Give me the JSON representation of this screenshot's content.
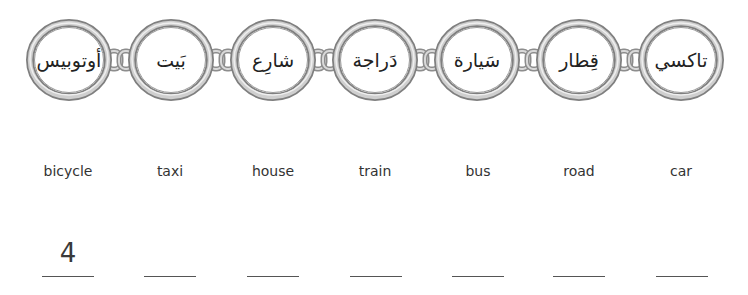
{
  "exercise": {
    "type": "match-arabic-to-english",
    "chain_rings": [
      {
        "arabic": "أوتوبيس"
      },
      {
        "arabic": "بَيت"
      },
      {
        "arabic": "شارِع"
      },
      {
        "arabic": "دَراجة"
      },
      {
        "arabic": "سَيارة"
      },
      {
        "arabic": "قِطار"
      },
      {
        "arabic": "تاكسي"
      }
    ],
    "english_words": [
      {
        "label": "bicycle",
        "answer": "4"
      },
      {
        "label": "taxi",
        "answer": ""
      },
      {
        "label": "house",
        "answer": ""
      },
      {
        "label": "train",
        "answer": ""
      },
      {
        "label": "bus",
        "answer": ""
      },
      {
        "label": "road",
        "answer": ""
      },
      {
        "label": "car",
        "answer": ""
      }
    ]
  },
  "colors": {
    "ring_outer": "#8a8a8a",
    "ring_mid": "#c8c8c8",
    "ring_inner": "#e8e8e8",
    "text": "#333333",
    "underline": "#555555"
  }
}
